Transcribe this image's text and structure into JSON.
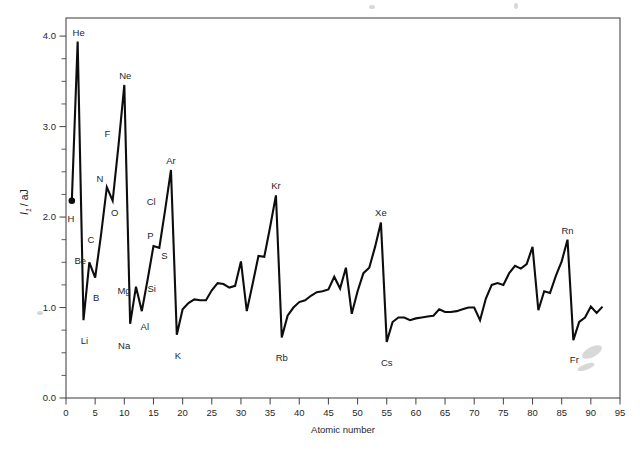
{
  "figure": {
    "background_color": "#ffffff",
    "line_color": "#0d0d0d",
    "axis_color": "#4a4a4a"
  },
  "axes": {
    "x": {
      "label": "Atomic number",
      "min": 0,
      "max": 95,
      "tick_step": 5,
      "tick_labels": [
        "0",
        "5",
        "10",
        "15",
        "20",
        "25",
        "30",
        "35",
        "40",
        "45",
        "50",
        "55",
        "60",
        "65",
        "70",
        "75",
        "80",
        "85",
        "90",
        "95"
      ]
    },
    "y": {
      "label_symbol": "I",
      "label_subscript": "1",
      "label_unit": "/ aJ",
      "label_full": "I1 / aJ",
      "min": 0.0,
      "max": 4.2,
      "major_tick_step": 1.0,
      "minor_tick_step": 0.25,
      "tick_labels": [
        "0.0",
        "1.0",
        "2.0",
        "3.0",
        "4.0"
      ],
      "tick_values": [
        0.0,
        1.0,
        2.0,
        3.0,
        4.0
      ]
    }
  },
  "chart_data": {
    "type": "line",
    "title": "",
    "xlabel": "Atomic number",
    "ylabel": "I1 / aJ",
    "xlim": [
      0,
      95
    ],
    "ylim": [
      0.0,
      4.2
    ],
    "grid": false,
    "legend": "none",
    "marker_points": [
      {
        "x": 1,
        "y": 2.18,
        "label": "H"
      }
    ],
    "series": [
      {
        "name": "First ionization energy",
        "x": [
          1,
          2,
          3,
          4,
          5,
          6,
          7,
          8,
          9,
          10,
          11,
          12,
          13,
          14,
          15,
          16,
          17,
          18,
          19,
          20,
          21,
          22,
          23,
          24,
          25,
          26,
          27,
          28,
          29,
          30,
          31,
          32,
          33,
          34,
          35,
          36,
          37,
          38,
          39,
          40,
          41,
          42,
          43,
          44,
          45,
          46,
          47,
          48,
          49,
          50,
          51,
          52,
          53,
          54,
          55,
          56,
          57,
          58,
          59,
          60,
          61,
          62,
          63,
          64,
          65,
          66,
          67,
          68,
          69,
          70,
          71,
          72,
          73,
          74,
          75,
          76,
          77,
          78,
          79,
          80,
          81,
          82,
          83,
          84,
          85,
          86,
          87,
          88,
          89,
          90,
          91,
          92
        ],
        "values": [
          2.18,
          3.94,
          0.86,
          1.5,
          1.33,
          1.8,
          2.33,
          2.18,
          2.79,
          3.46,
          0.82,
          1.23,
          0.96,
          1.31,
          1.68,
          1.66,
          2.08,
          2.52,
          0.7,
          0.98,
          1.05,
          1.09,
          1.08,
          1.08,
          1.19,
          1.27,
          1.26,
          1.22,
          1.24,
          1.51,
          0.96,
          1.26,
          1.57,
          1.56,
          1.89,
          2.24,
          0.67,
          0.91,
          1.0,
          1.06,
          1.08,
          1.13,
          1.17,
          1.18,
          1.2,
          1.34,
          1.21,
          1.44,
          0.93,
          1.18,
          1.38,
          1.44,
          1.67,
          1.94,
          0.62,
          0.84,
          0.89,
          0.89,
          0.86,
          0.88,
          0.89,
          0.9,
          0.91,
          0.98,
          0.95,
          0.95,
          0.96,
          0.98,
          1.0,
          1.0,
          0.86,
          1.1,
          1.25,
          1.27,
          1.25,
          1.38,
          1.46,
          1.43,
          1.48,
          1.67,
          0.97,
          1.18,
          1.16,
          1.35,
          1.51,
          1.75,
          0.64,
          0.84,
          0.89,
          1.01,
          0.94,
          1.01
        ],
        "annotations": [
          {
            "element": "H",
            "x": 1,
            "value": 2.18,
            "label_position": "below"
          },
          {
            "element": "He",
            "x": 2,
            "value": 3.94,
            "label_position": "above"
          },
          {
            "element": "Li",
            "x": 3,
            "value": 0.86,
            "label_position": "below"
          },
          {
            "element": "Be",
            "x": 4,
            "value": 1.5,
            "label_position": "left"
          },
          {
            "element": "B",
            "x": 5,
            "value": 1.33,
            "label_position": "below"
          },
          {
            "element": "C",
            "x": 6,
            "value": 1.8,
            "label_position": "left"
          },
          {
            "element": "N",
            "x": 7,
            "value": 2.33,
            "label_position": "above"
          },
          {
            "element": "O",
            "x": 8,
            "value": 2.18,
            "label_position": "below"
          },
          {
            "element": "F",
            "x": 9,
            "value": 2.79,
            "label_position": "left"
          },
          {
            "element": "Ne",
            "x": 10,
            "value": 3.46,
            "label_position": "above"
          },
          {
            "element": "Na",
            "x": 11,
            "value": 0.82,
            "label_position": "below"
          },
          {
            "element": "Mg",
            "x": 12,
            "value": 1.23,
            "label_position": "left"
          },
          {
            "element": "Al",
            "x": 13,
            "value": 0.96,
            "label_position": "below"
          },
          {
            "element": "Si",
            "x": 14,
            "value": 1.31,
            "label_position": "right"
          },
          {
            "element": "P",
            "x": 15,
            "value": 1.68,
            "label_position": "above"
          },
          {
            "element": "S",
            "x": 16,
            "value": 1.66,
            "label_position": "below"
          },
          {
            "element": "Cl",
            "x": 17,
            "value": 2.08,
            "label_position": "left"
          },
          {
            "element": "Ar",
            "x": 18,
            "value": 2.52,
            "label_position": "above"
          },
          {
            "element": "K",
            "x": 19,
            "value": 0.7,
            "label_position": "below"
          },
          {
            "element": "Kr",
            "x": 36,
            "value": 2.24,
            "label_position": "above"
          },
          {
            "element": "Rb",
            "x": 37,
            "value": 0.67,
            "label_position": "below"
          },
          {
            "element": "Xe",
            "x": 54,
            "value": 1.94,
            "label_position": "above"
          },
          {
            "element": "Cs",
            "x": 55,
            "value": 0.62,
            "label_position": "below"
          },
          {
            "element": "Rn",
            "x": 86,
            "value": 1.75,
            "label_position": "above"
          },
          {
            "element": "Fr",
            "x": 87,
            "value": 0.64,
            "label_position": "below"
          }
        ]
      }
    ]
  }
}
